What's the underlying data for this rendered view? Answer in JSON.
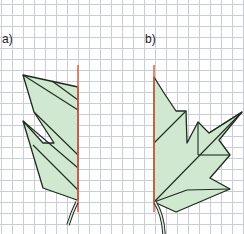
{
  "labels": {
    "a": "a)",
    "b": "b)"
  },
  "colors": {
    "fill": "#cfe8cf",
    "stroke": "#1e2a1e",
    "axis": "#e06040",
    "grid": "#c9cdd4"
  },
  "figures": [
    {
      "id": "a",
      "description": "Half leaf with red symmetry axis (narrow willow-like, two lobes)"
    },
    {
      "id": "b",
      "description": "Half maple leaf with red symmetry axis"
    }
  ]
}
